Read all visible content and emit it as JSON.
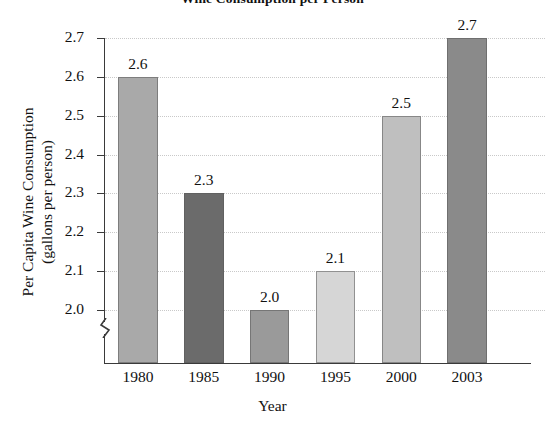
{
  "chart_data": {
    "type": "bar",
    "title": "Wine Consumption per Person",
    "xlabel": "Year",
    "ylabel_line1": "Per Capita Wine Consumption",
    "ylabel_line2": "(gallons per person)",
    "categories": [
      "1980",
      "1985",
      "1990",
      "1995",
      "2000",
      "2003"
    ],
    "values": [
      2.6,
      2.3,
      2.0,
      2.1,
      2.5,
      2.7
    ],
    "value_labels": [
      "2.6",
      "2.3",
      "2.0",
      "2.1",
      "2.5",
      "2.7"
    ],
    "ylim": [
      2.0,
      2.7
    ],
    "y_ticks": [
      2.0,
      2.1,
      2.2,
      2.3,
      2.4,
      2.5,
      2.6,
      2.7
    ],
    "y_tick_labels": [
      "2.0",
      "2.1",
      "2.2",
      "2.3",
      "2.4",
      "2.5",
      "2.6",
      "2.7"
    ],
    "y_axis_break": true,
    "grid": "horizontal-dotted",
    "legend": "none",
    "bar_colors": [
      "#a9a9a9",
      "#6b6b6b",
      "#9a9a9a",
      "#d6d6d6",
      "#bfbfbf",
      "#8a8a8a"
    ],
    "axis_color": "#3a3a3a",
    "grid_color": "#c9c9c9",
    "background": "#ffffff"
  }
}
